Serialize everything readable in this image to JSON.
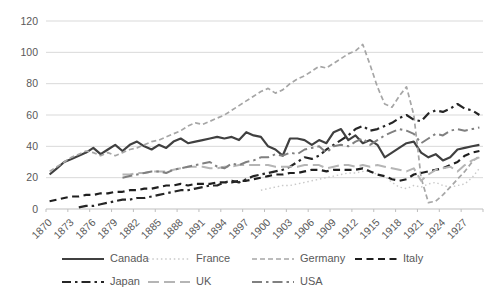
{
  "chart_data": {
    "type": "line",
    "title": "",
    "xlabel": "",
    "ylabel": "",
    "x_start_year": 1870,
    "x_end_year": 1929,
    "x_tick_labels": [
      "1870",
      "1873",
      "1876",
      "1879",
      "1882",
      "1885",
      "1888",
      "1891",
      "1894",
      "1897",
      "1900",
      "1903",
      "1906",
      "1909",
      "1912",
      "1915",
      "1918",
      "1921",
      "1924",
      "1927"
    ],
    "ylim": [
      0,
      120
    ],
    "y_ticks": [
      0,
      20,
      40,
      60,
      80,
      100,
      120
    ],
    "grid": "horizontal",
    "legend_position": "bottom",
    "colors": {
      "background": "#ffffff",
      "gridline": "#d9d9d9",
      "axis_line": "#bfbfbf",
      "axis_text": "#595959"
    },
    "series": [
      {
        "name": "Canada",
        "color": "#404040",
        "dash": "",
        "width": 2.2,
        "legend_row": 0,
        "values": [
          22,
          26,
          30,
          32,
          34,
          36,
          39,
          35,
          38,
          41,
          37,
          41,
          43,
          40,
          38,
          41,
          39,
          43,
          45,
          42,
          43,
          44,
          45,
          46,
          45,
          46,
          44,
          49,
          47,
          46,
          40,
          38,
          34,
          45,
          45,
          44,
          41,
          44,
          42,
          49,
          51,
          44,
          47,
          42,
          44,
          41,
          33,
          36,
          39,
          42,
          43,
          36,
          33,
          35,
          31,
          33,
          38,
          39,
          40,
          41
        ]
      },
      {
        "name": "France",
        "color": "#c9c9c9",
        "dash": "1.5 2.8",
        "width": 1.4,
        "legend_row": 0,
        "values": [
          null,
          null,
          null,
          null,
          null,
          null,
          null,
          null,
          null,
          null,
          null,
          null,
          null,
          null,
          null,
          null,
          null,
          null,
          null,
          null,
          null,
          null,
          null,
          null,
          null,
          null,
          null,
          null,
          null,
          12,
          13,
          14,
          15,
          15,
          16,
          17,
          18,
          19,
          20,
          21,
          22,
          23,
          23,
          24,
          24,
          22,
          21,
          17,
          14,
          13,
          15,
          14,
          16,
          17,
          15,
          14,
          15,
          16,
          20,
          26
        ]
      },
      {
        "name": "Germany",
        "color": "#a6a6a6",
        "dash": "5 3",
        "width": 1.7,
        "legend_row": 0,
        "values": [
          24,
          27,
          30,
          33,
          35,
          37,
          36,
          34,
          36,
          34,
          36,
          38,
          39,
          41,
          43,
          44,
          46,
          48,
          50,
          53,
          55,
          54,
          56,
          58,
          60,
          63,
          66,
          69,
          72,
          75,
          77,
          74,
          76,
          80,
          83,
          85,
          88,
          91,
          90,
          93,
          96,
          99,
          101,
          105,
          92,
          78,
          67,
          65,
          72,
          78,
          60,
          20,
          4,
          5,
          9,
          14,
          19,
          24,
          30,
          34
        ]
      },
      {
        "name": "Italy",
        "color": "#1f1f1f",
        "dash": "7 4.5",
        "width": 2.2,
        "legend_row": 0,
        "values": [
          5,
          6,
          7,
          8,
          8,
          9,
          9,
          10,
          10,
          11,
          11,
          12,
          12,
          13,
          13,
          14,
          15,
          15,
          16,
          15,
          16,
          16,
          16,
          17,
          17,
          17,
          18,
          18,
          19,
          20,
          21,
          22,
          22,
          23,
          23,
          24,
          25,
          25,
          24,
          25,
          25,
          25,
          25,
          26,
          24,
          22,
          21,
          19,
          18,
          19,
          22,
          23,
          24,
          25,
          26,
          28,
          30,
          34,
          36,
          37
        ]
      },
      {
        "name": "Japan",
        "color": "#262626",
        "dash": "9 4 2.5 4",
        "width": 2.2,
        "legend_row": 1,
        "values": [
          null,
          null,
          null,
          null,
          1,
          2,
          2,
          3,
          4,
          5,
          6,
          6,
          7,
          7,
          8,
          9,
          10,
          11,
          12,
          12,
          13,
          14,
          15,
          15,
          17,
          18,
          17,
          19,
          21,
          22,
          23,
          24,
          25,
          27,
          30,
          33,
          32,
          34,
          38,
          41,
          44,
          47,
          51,
          53,
          50,
          51,
          53,
          55,
          58,
          60,
          57,
          56,
          61,
          63,
          62,
          64,
          67,
          64,
          63,
          60
        ]
      },
      {
        "name": "UK",
        "color": "#b5b5b5",
        "dash": "11 5",
        "width": 2,
        "legend_row": 1,
        "values": [
          null,
          null,
          null,
          null,
          null,
          null,
          null,
          null,
          null,
          null,
          22,
          22,
          23,
          23,
          24,
          24,
          24,
          25,
          26,
          27,
          27,
          27,
          26,
          26,
          27,
          27,
          28,
          28,
          28,
          28,
          28,
          27,
          27,
          27,
          27,
          28,
          28,
          28,
          26,
          27,
          28,
          28,
          27,
          28,
          27,
          28,
          27,
          26,
          25,
          24,
          26,
          18,
          22,
          25,
          26,
          27,
          24,
          28,
          31,
          33
        ]
      },
      {
        "name": "USA",
        "color": "#808080",
        "dash": "10 4 2.5 4",
        "width": 2,
        "legend_row": 1,
        "values": [
          null,
          null,
          null,
          null,
          null,
          null,
          null,
          null,
          null,
          null,
          20,
          21,
          22,
          23,
          24,
          24,
          23,
          25,
          26,
          27,
          28,
          29,
          30,
          27,
          26,
          29,
          28,
          30,
          31,
          33,
          33,
          35,
          34,
          36,
          35,
          38,
          39,
          40,
          36,
          40,
          41,
          40,
          43,
          45,
          41,
          44,
          47,
          49,
          51,
          50,
          48,
          42,
          45,
          48,
          47,
          50,
          51,
          50,
          51,
          52
        ]
      }
    ]
  }
}
